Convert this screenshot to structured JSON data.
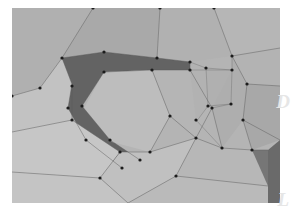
{
  "figure": {
    "kind": "3d-mesh-planar-segmentation",
    "canvas": {
      "width": 291,
      "height": 220
    },
    "background_color": "#ffffff",
    "content_frame": {
      "x": 12,
      "y": 8,
      "width": 268,
      "height": 195
    },
    "edge_color": "#5a5a5a",
    "vertex_color": "#1a1a1a",
    "vertex_radius": 1.6,
    "edge_width": 0.55,
    "wire_width": 0.45
  },
  "watermarks": [
    {
      "id": "watermark-d",
      "text": "D",
      "color": "#e6e6e6"
    },
    {
      "id": "watermark-l",
      "text": "L",
      "color": "#e6e6e6"
    }
  ],
  "palette": {
    "light_1": "#c9c9c9",
    "light_2": "#c2c2c2",
    "light_3": "#bcbcbc",
    "mid_1": "#b4b4b4",
    "mid_2": "#ababab",
    "mid_3": "#a3a3a3",
    "mid_4": "#9c9c9c",
    "dark_1": "#8a8a8a",
    "dark_2": "#7d7d7d",
    "dark_3": "#6f6f6f",
    "dark_4": "#5f5f5f",
    "darkest": "#545454"
  },
  "chart_data": {
    "type": "mesh",
    "title": "",
    "faces": [
      {
        "name": "face-top-left-upper",
        "fill": "#b0b0b0",
        "points": [
          [
            12,
            8
          ],
          [
            93,
            8
          ],
          [
            62,
            58
          ],
          [
            40,
            88
          ],
          [
            12,
            96
          ]
        ]
      },
      {
        "name": "face-top-center",
        "fill": "#a9a9a9",
        "points": [
          [
            93,
            8
          ],
          [
            160,
            8
          ],
          [
            157,
            58
          ],
          [
            104,
            52
          ],
          [
            62,
            58
          ]
        ]
      },
      {
        "name": "face-top-right-a",
        "fill": "#b1b1b1",
        "points": [
          [
            160,
            8
          ],
          [
            214,
            8
          ],
          [
            232,
            56
          ],
          [
            190,
            62
          ],
          [
            157,
            58
          ]
        ]
      },
      {
        "name": "face-top-right-b",
        "fill": "#b6b6b6",
        "points": [
          [
            214,
            8
          ],
          [
            280,
            8
          ],
          [
            280,
            48
          ],
          [
            232,
            56
          ]
        ]
      },
      {
        "name": "face-right-upper",
        "fill": "#b3b3b3",
        "points": [
          [
            232,
            56
          ],
          [
            280,
            48
          ],
          [
            280,
            86
          ],
          [
            247,
            84
          ]
        ]
      },
      {
        "name": "face-left-mid",
        "fill": "#c2c2c2",
        "points": [
          [
            12,
            96
          ],
          [
            40,
            88
          ],
          [
            62,
            58
          ],
          [
            72,
            86
          ],
          [
            72,
            120
          ],
          [
            12,
            132
          ]
        ]
      },
      {
        "name": "face-dark-hook",
        "fill": "#636363",
        "points": [
          [
            62,
            58
          ],
          [
            104,
            52
          ],
          [
            157,
            58
          ],
          [
            190,
            62
          ],
          [
            190,
            70
          ],
          [
            152,
            70
          ],
          [
            104,
            72
          ],
          [
            82,
            106
          ],
          [
            110,
            140
          ],
          [
            140,
            160
          ],
          [
            122,
            168
          ],
          [
            86,
            140
          ],
          [
            68,
            108
          ],
          [
            72,
            84
          ]
        ]
      },
      {
        "name": "face-center-big",
        "fill": "#bdbdbd",
        "points": [
          [
            104,
            72
          ],
          [
            152,
            70
          ],
          [
            170,
            116
          ],
          [
            150,
            152
          ],
          [
            112,
            142
          ],
          [
            84,
            108
          ]
        ]
      },
      {
        "name": "face-center-right",
        "fill": "#b5b5b5",
        "points": [
          [
            152,
            70
          ],
          [
            190,
            70
          ],
          [
            212,
            108
          ],
          [
            196,
            138
          ],
          [
            170,
            116
          ]
        ]
      },
      {
        "name": "face-wire-strip-a",
        "fill": "#b2b2b2",
        "points": [
          [
            190,
            62
          ],
          [
            206,
            68
          ],
          [
            208,
            106
          ],
          [
            196,
            120
          ],
          [
            190,
            70
          ]
        ]
      },
      {
        "name": "face-wire-strip-b",
        "fill": "#b0b0b0",
        "points": [
          [
            206,
            68
          ],
          [
            232,
            70
          ],
          [
            231,
            104
          ],
          [
            209,
            107
          ]
        ]
      },
      {
        "name": "face-right-lower",
        "fill": "#aeaeae",
        "points": [
          [
            232,
            56
          ],
          [
            247,
            84
          ],
          [
            243,
            120
          ],
          [
            222,
            148
          ],
          [
            212,
            108
          ],
          [
            232,
            70
          ]
        ]
      },
      {
        "name": "face-right-edge-low",
        "fill": "#a8a8a8",
        "points": [
          [
            247,
            84
          ],
          [
            280,
            86
          ],
          [
            280,
            140
          ],
          [
            252,
            150
          ],
          [
            243,
            120
          ]
        ]
      },
      {
        "name": "face-bottom-left",
        "fill": "#c6c6c6",
        "points": [
          [
            12,
            132
          ],
          [
            72,
            120
          ],
          [
            120,
            152
          ],
          [
            100,
            178
          ],
          [
            12,
            172
          ]
        ]
      },
      {
        "name": "face-bottom-left-low",
        "fill": "#c4c4c4",
        "points": [
          [
            12,
            172
          ],
          [
            100,
            178
          ],
          [
            128,
            203
          ],
          [
            12,
            203
          ]
        ]
      },
      {
        "name": "face-bottom-center",
        "fill": "#c0c0c0",
        "points": [
          [
            120,
            152
          ],
          [
            150,
            152
          ],
          [
            196,
            138
          ],
          [
            176,
            176
          ],
          [
            128,
            203
          ],
          [
            100,
            178
          ]
        ]
      },
      {
        "name": "face-bottom-right",
        "fill": "#b7b7b7",
        "points": [
          [
            196,
            138
          ],
          [
            222,
            148
          ],
          [
            252,
            150
          ],
          [
            268,
            186
          ],
          [
            176,
            176
          ]
        ]
      },
      {
        "name": "face-bottom-strip",
        "fill": "#bababa",
        "points": [
          [
            128,
            203
          ],
          [
            176,
            176
          ],
          [
            268,
            186
          ],
          [
            268,
            203
          ]
        ]
      },
      {
        "name": "face-corner-dark",
        "fill": "#6a6a6a",
        "points": [
          [
            268,
            150
          ],
          [
            280,
            140
          ],
          [
            280,
            203
          ],
          [
            268,
            203
          ]
        ]
      },
      {
        "name": "face-corner-dark-2",
        "fill": "#767676",
        "points": [
          [
            252,
            150
          ],
          [
            268,
            150
          ],
          [
            268,
            186
          ]
        ]
      }
    ],
    "edges": [
      {
        "name": "edge-tl-1",
        "points": [
          [
            93,
            8
          ],
          [
            62,
            58
          ]
        ]
      },
      {
        "name": "edge-tl-2",
        "points": [
          [
            62,
            58
          ],
          [
            40,
            88
          ],
          [
            12,
            96
          ]
        ]
      },
      {
        "name": "edge-tl-3",
        "points": [
          [
            62,
            58
          ],
          [
            72,
            84
          ],
          [
            68,
            108
          ],
          [
            86,
            140
          ],
          [
            122,
            168
          ]
        ]
      },
      {
        "name": "edge-tc-1",
        "points": [
          [
            160,
            8
          ],
          [
            157,
            58
          ]
        ]
      },
      {
        "name": "edge-tc-2",
        "points": [
          [
            62,
            58
          ],
          [
            104,
            52
          ],
          [
            157,
            58
          ],
          [
            190,
            62
          ]
        ]
      },
      {
        "name": "edge-tr-1",
        "points": [
          [
            214,
            8
          ],
          [
            232,
            56
          ]
        ]
      },
      {
        "name": "edge-tr-2",
        "points": [
          [
            232,
            56
          ],
          [
            280,
            48
          ]
        ]
      },
      {
        "name": "edge-tr-3",
        "points": [
          [
            232,
            56
          ],
          [
            247,
            84
          ],
          [
            280,
            86
          ]
        ]
      },
      {
        "name": "edge-hook-inner",
        "points": [
          [
            190,
            70
          ],
          [
            152,
            70
          ],
          [
            104,
            72
          ],
          [
            82,
            106
          ],
          [
            110,
            140
          ],
          [
            140,
            160
          ]
        ]
      },
      {
        "name": "edge-hook-right",
        "points": [
          [
            190,
            62
          ],
          [
            190,
            70
          ]
        ]
      },
      {
        "name": "edge-center-1",
        "points": [
          [
            152,
            70
          ],
          [
            170,
            116
          ],
          [
            150,
            152
          ]
        ]
      },
      {
        "name": "edge-center-2",
        "points": [
          [
            170,
            116
          ],
          [
            196,
            138
          ]
        ]
      },
      {
        "name": "edge-center-3",
        "points": [
          [
            190,
            70
          ],
          [
            212,
            108
          ],
          [
            196,
            138
          ]
        ]
      },
      {
        "name": "edge-left-mid",
        "points": [
          [
            12,
            132
          ],
          [
            72,
            120
          ],
          [
            72,
            86
          ]
        ]
      },
      {
        "name": "edge-bottom-1",
        "points": [
          [
            72,
            120
          ],
          [
            120,
            152
          ],
          [
            150,
            152
          ]
        ]
      },
      {
        "name": "edge-bottom-2",
        "points": [
          [
            120,
            152
          ],
          [
            100,
            178
          ],
          [
            12,
            172
          ]
        ]
      },
      {
        "name": "edge-bottom-3",
        "points": [
          [
            100,
            178
          ],
          [
            128,
            203
          ]
        ]
      },
      {
        "name": "edge-bottom-4",
        "points": [
          [
            150,
            152
          ],
          [
            196,
            138
          ],
          [
            222,
            148
          ],
          [
            252,
            150
          ],
          [
            268,
            150
          ]
        ]
      },
      {
        "name": "edge-bottom-5",
        "points": [
          [
            176,
            176
          ],
          [
            268,
            186
          ]
        ]
      },
      {
        "name": "edge-bottom-6",
        "points": [
          [
            128,
            203
          ],
          [
            176,
            176
          ],
          [
            196,
            138
          ]
        ]
      },
      {
        "name": "edge-right-low",
        "points": [
          [
            212,
            108
          ],
          [
            222,
            148
          ]
        ]
      },
      {
        "name": "edge-right-low-2",
        "points": [
          [
            243,
            120
          ],
          [
            252,
            150
          ]
        ]
      },
      {
        "name": "edge-right-low-3",
        "points": [
          [
            247,
            84
          ],
          [
            243,
            120
          ],
          [
            280,
            140
          ]
        ]
      }
    ],
    "wires": [
      {
        "name": "wire-1",
        "points": [
          [
            190,
            62
          ],
          [
            206,
            68
          ],
          [
            208,
            106
          ],
          [
            196,
            122
          ]
        ]
      },
      {
        "name": "wire-2",
        "points": [
          [
            206,
            68
          ],
          [
            232,
            70
          ],
          [
            231,
            104
          ],
          [
            212,
            108
          ]
        ]
      },
      {
        "name": "wire-3",
        "points": [
          [
            190,
            70
          ],
          [
            232,
            70
          ]
        ]
      },
      {
        "name": "wire-4",
        "points": [
          [
            208,
            106
          ],
          [
            231,
            104
          ]
        ]
      },
      {
        "name": "wire-5",
        "points": [
          [
            232,
            70
          ],
          [
            232,
            56
          ]
        ]
      },
      {
        "name": "wire-6",
        "points": [
          [
            196,
            120
          ],
          [
            222,
            148
          ]
        ]
      }
    ],
    "vertices": [
      [
        93,
        8
      ],
      [
        160,
        8
      ],
      [
        214,
        8
      ],
      [
        62,
        58
      ],
      [
        104,
        52
      ],
      [
        157,
        58
      ],
      [
        190,
        62
      ],
      [
        232,
        56
      ],
      [
        40,
        88
      ],
      [
        72,
        86
      ],
      [
        104,
        72
      ],
      [
        152,
        70
      ],
      [
        190,
        70
      ],
      [
        206,
        68
      ],
      [
        232,
        70
      ],
      [
        12,
        96
      ],
      [
        68,
        108
      ],
      [
        82,
        106
      ],
      [
        208,
        106
      ],
      [
        231,
        104
      ],
      [
        212,
        108
      ],
      [
        247,
        84
      ],
      [
        72,
        120
      ],
      [
        196,
        120
      ],
      [
        243,
        120
      ],
      [
        110,
        140
      ],
      [
        86,
        140
      ],
      [
        120,
        152
      ],
      [
        150,
        152
      ],
      [
        196,
        138
      ],
      [
        222,
        148
      ],
      [
        140,
        160
      ],
      [
        122,
        168
      ],
      [
        176,
        176
      ],
      [
        100,
        178
      ],
      [
        252,
        150
      ],
      [
        170,
        116
      ]
    ]
  }
}
